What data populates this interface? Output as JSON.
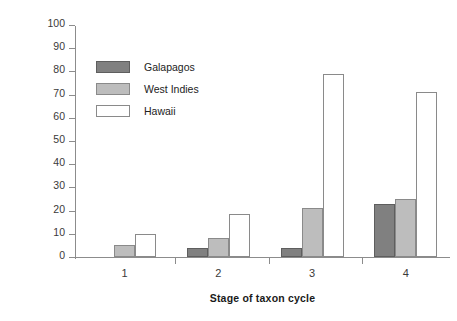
{
  "chart_data": {
    "type": "bar",
    "title": "",
    "xlabel": "Stage of taxon cycle",
    "ylabel": "Percentage extinct or threatened",
    "categories": [
      "1",
      "2",
      "3",
      "4"
    ],
    "ylim": [
      0,
      100
    ],
    "ytick_step": 10,
    "yticks": [
      "0",
      "10",
      "20",
      "30",
      "40",
      "50",
      "60",
      "70",
      "80",
      "90",
      "100"
    ],
    "grid": false,
    "legend_position": "upper-left-inside",
    "series": [
      {
        "name": "Galapagos",
        "values": [
          0,
          4,
          4,
          23
        ],
        "color": "#808080",
        "border": "#5e5e5e"
      },
      {
        "name": "West Indies",
        "values": [
          5,
          8,
          21,
          25
        ],
        "color": "#bdbdbd",
        "border": "#8a8a8a"
      },
      {
        "name": "Hawaii",
        "values": [
          10,
          18.5,
          79,
          71
        ],
        "color": "#ffffff",
        "border": "#8a8a8a"
      }
    ]
  }
}
